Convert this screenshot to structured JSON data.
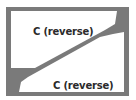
{
  "diagram": {
    "colors": {
      "frame": "#7a7a7a",
      "region_fill": "#ffffff",
      "text": "#2a2a2a",
      "background": "#ffffff"
    },
    "regions": [
      {
        "id": "upper",
        "label": "C (reverse)"
      },
      {
        "id": "lower",
        "label": "C (reverse)"
      }
    ]
  }
}
